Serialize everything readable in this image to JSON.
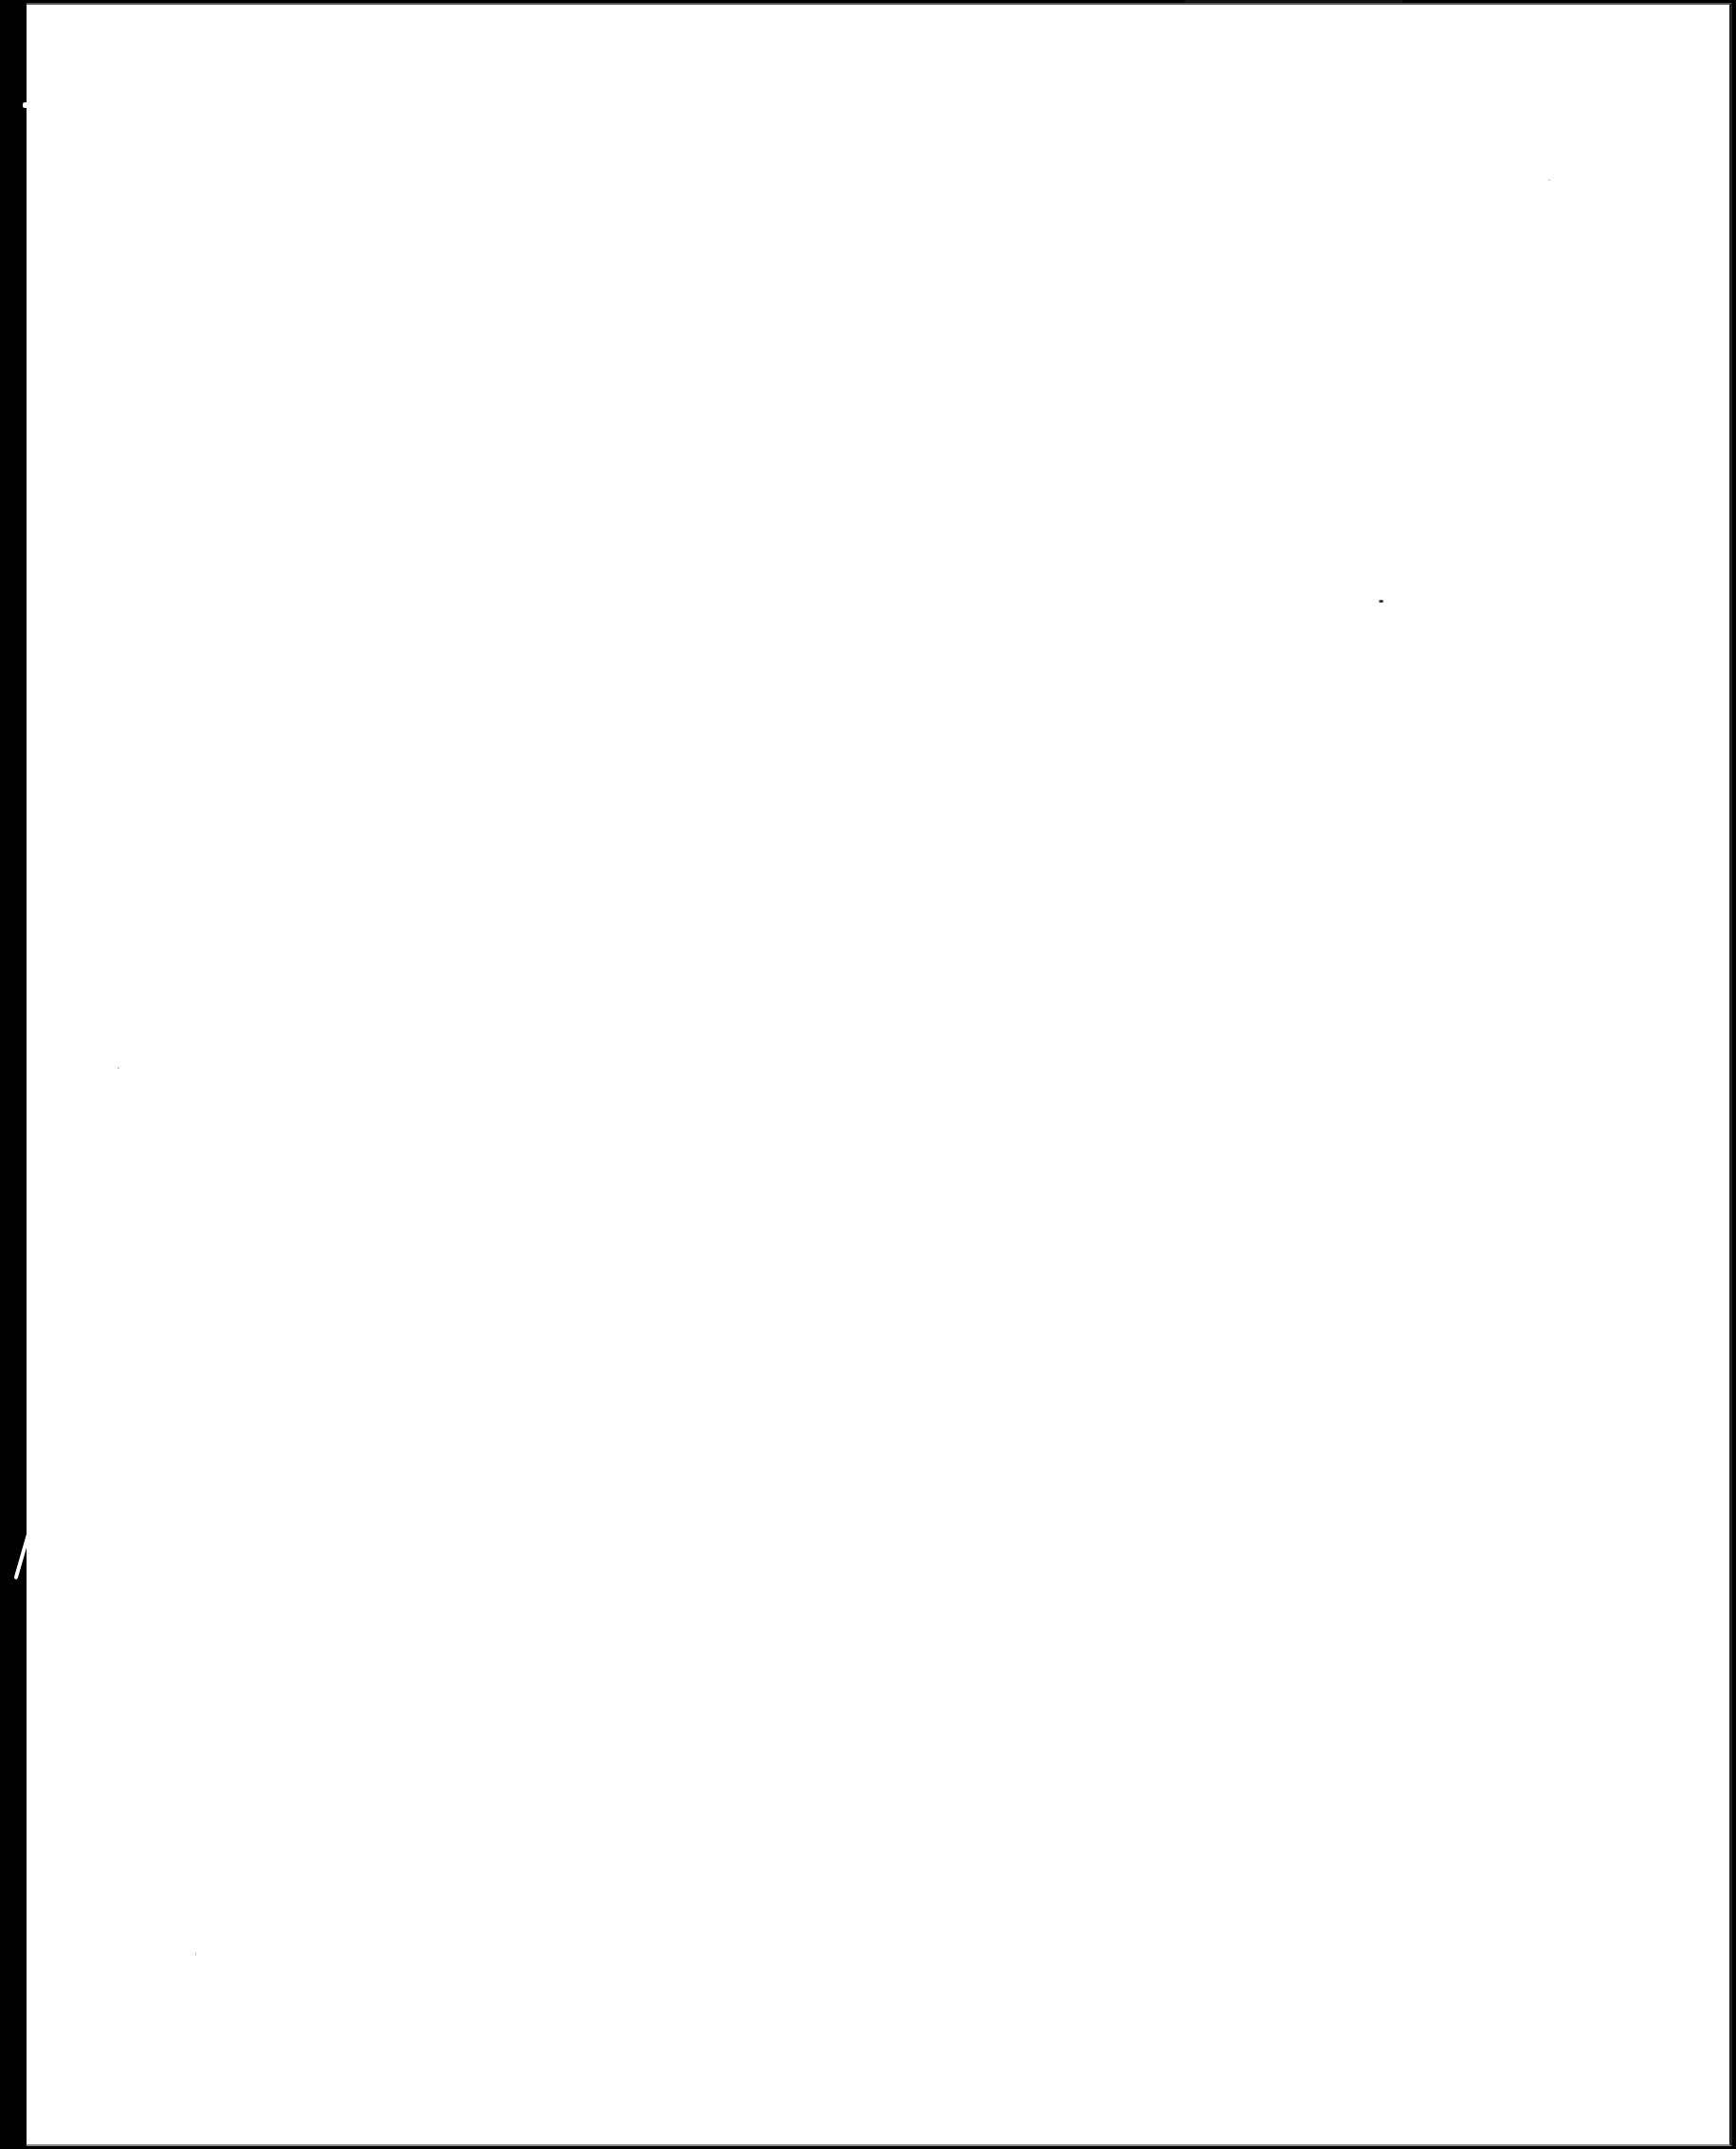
{
  "document": {
    "type": "scanned-page",
    "content": "",
    "background_color": "#ffffff",
    "scan_edge_color": "#000000"
  },
  "artifacts": {
    "specks": [
      {
        "x": 1455,
        "y": 633,
        "size": 5
      },
      {
        "x": 124,
        "y": 1126,
        "size": 2
      },
      {
        "x": 1634,
        "y": 189,
        "size": 2
      },
      {
        "x": 206,
        "y": 2060,
        "size": 2
      }
    ],
    "edge_streaks": [
      {
        "x": 30,
        "y": 1465,
        "length": 30,
        "angle": 200
      },
      {
        "x": 38,
        "y": 1570,
        "length": 100,
        "angle": 196
      }
    ]
  }
}
